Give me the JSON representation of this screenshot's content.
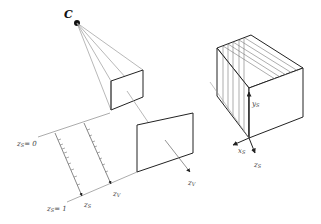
{
  "diagram": {
    "camera_label": "C",
    "left_figure": {
      "axis_labels": {
        "zs_0": "z",
        "zs_0_sub": "S",
        "zs_0_eq": "= 0",
        "zs_1": "z",
        "zs_1_sub": "S",
        "zs_1_eq": "= 1",
        "zs": "z",
        "zs_sub": "S",
        "zv_bottom": "z",
        "zv_bottom_sub": "V",
        "zv_arrow": "z",
        "zv_arrow_sub": "V"
      }
    },
    "right_figure": {
      "axis_labels": {
        "ys": "y",
        "ys_sub": "S",
        "xs": "x",
        "xs_sub": "S",
        "zs": "z",
        "zs_sub": "S"
      }
    },
    "colors": {
      "stroke_dark": "#222222",
      "stroke_light": "#9a9a9a",
      "background": "#ffffff"
    }
  }
}
